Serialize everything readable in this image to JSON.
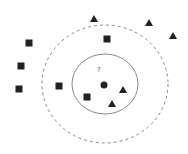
{
  "diagram": {
    "title": "",
    "query_label": "?",
    "query_point": {
      "x": 104,
      "y": 85
    },
    "query_label_pos": {
      "x": 97,
      "y": 66
    },
    "inner_circle": {
      "cx": 105,
      "cy": 84,
      "rx": 33,
      "ry": 30,
      "style": "solid"
    },
    "outer_circle": {
      "cx": 105,
      "cy": 84,
      "rx": 63,
      "ry": 59,
      "style": "dashed"
    },
    "squares": [
      {
        "x": 29,
        "y": 43
      },
      {
        "x": 21,
        "y": 66
      },
      {
        "x": 19,
        "y": 89
      },
      {
        "x": 59,
        "y": 86
      },
      {
        "x": 87,
        "y": 97
      },
      {
        "x": 107,
        "y": 39
      }
    ],
    "triangles": [
      {
        "x": 94,
        "y": 19
      },
      {
        "x": 149,
        "y": 23
      },
      {
        "x": 173,
        "y": 36
      },
      {
        "x": 123,
        "y": 90
      },
      {
        "x": 112,
        "y": 104
      }
    ],
    "colors": {
      "marker": "#222222",
      "line": "#888888",
      "background": "#ffffff"
    }
  }
}
